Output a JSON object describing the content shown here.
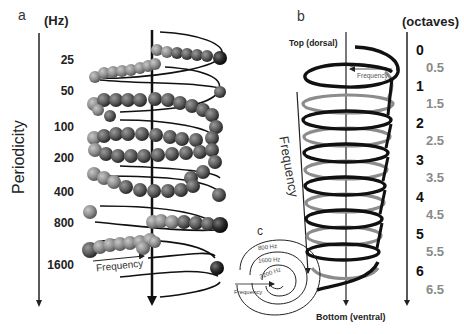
{
  "panel_a": {
    "letter": "a",
    "unit": "(Hz)",
    "axis_label": "Periodicity",
    "ticks": [
      "25",
      "50",
      "100",
      "200",
      "400",
      "800",
      "1600"
    ],
    "arrow_label": "Frequency"
  },
  "panel_b": {
    "letter": "b",
    "unit": "(octaves)",
    "top_label": "Top (dorsal)",
    "bottom_label": "Bottom (ventral)",
    "top_arrow_label": "Frequency",
    "side_arrow_label": "Frequency",
    "octave_ticks": [
      {
        "value": "0",
        "type": "integer"
      },
      {
        "value": "0.5",
        "type": "half"
      },
      {
        "value": "1",
        "type": "integer"
      },
      {
        "value": "1.5",
        "type": "half"
      },
      {
        "value": "2",
        "type": "integer"
      },
      {
        "value": "2.5",
        "type": "half"
      },
      {
        "value": "3",
        "type": "integer"
      },
      {
        "value": "3.5",
        "type": "half"
      },
      {
        "value": "4",
        "type": "integer"
      },
      {
        "value": "4.5",
        "type": "half"
      },
      {
        "value": "5",
        "type": "integer"
      },
      {
        "value": "5.5",
        "type": "half"
      },
      {
        "value": "6",
        "type": "integer"
      },
      {
        "value": "6.5",
        "type": "half"
      }
    ],
    "colors": {
      "integer_coil": "#111111",
      "half_coil": "#8c8c8c"
    }
  },
  "panel_c": {
    "letter": "c",
    "rings": [
      "800 Hz",
      "1600 Hz",
      "3200 Hz"
    ],
    "arrow_label": "Frequency"
  }
}
